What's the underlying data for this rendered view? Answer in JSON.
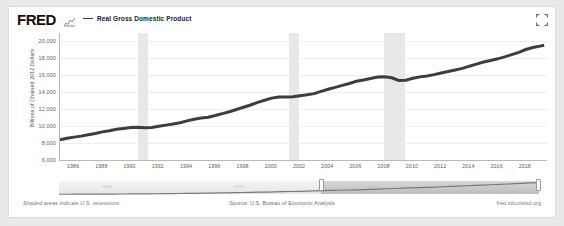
{
  "header": {
    "logo": "FRED",
    "logo_mark_icon": "fred-squiggle-icon",
    "legend_label": "Real Gross Domestic Product",
    "fullscreen_icon": "fullscreen-expand-icon"
  },
  "footer": {
    "left_note": "Shaded areas indicate U.S. recessions",
    "source": "Source: U.S. Bureau of Economic Analysis",
    "site": "fred.stlouisfed.org"
  },
  "slider": {
    "minimap_years": [
      "1950",
      "1970",
      "1990",
      "2010"
    ],
    "left_handle_icon": "slider-handle-left",
    "right_handle_icon": "slider-handle-right"
  },
  "chart_data": {
    "type": "line",
    "title": "",
    "xlabel": "",
    "ylabel": "Billions of Chained 2012 Dollars",
    "xlim": [
      1985.0,
      2019.5
    ],
    "ylim": [
      6000,
      21000
    ],
    "yticks": [
      6000,
      8000,
      10000,
      12000,
      14000,
      16000,
      18000,
      20000
    ],
    "ytick_labels": [
      "6,000",
      "8,000",
      "10,000",
      "12,000",
      "14,000",
      "16,000",
      "18,000",
      "20,000"
    ],
    "xticks": [
      1986,
      1988,
      1990,
      1992,
      1994,
      1996,
      1998,
      2000,
      2002,
      2004,
      2006,
      2008,
      2010,
      2012,
      2014,
      2016,
      2018
    ],
    "xtick_labels": [
      "1986",
      "1988",
      "1990",
      "1992",
      "1994",
      "1996",
      "1998",
      "2000",
      "2002",
      "2004",
      "2006",
      "2008",
      "2010",
      "2012",
      "2014",
      "2016",
      "2018"
    ],
    "grid": true,
    "legend_position": "top-left",
    "line_color": "#3d3d3d",
    "recession_color": "#e8e8e8",
    "recession_bands": [
      {
        "start": 1990.5,
        "end": 1991.2
      },
      {
        "start": 2001.2,
        "end": 2001.9
      },
      {
        "start": 2007.95,
        "end": 2009.45
      }
    ],
    "series": [
      {
        "name": "Real Gross Domestic Product",
        "x": [
          1985.0,
          1985.5,
          1986.0,
          1986.5,
          1987.0,
          1987.5,
          1988.0,
          1988.5,
          1989.0,
          1989.5,
          1990.0,
          1990.5,
          1991.0,
          1991.5,
          1992.0,
          1992.5,
          1993.0,
          1993.5,
          1994.0,
          1994.5,
          1995.0,
          1995.5,
          1996.0,
          1996.5,
          1997.0,
          1997.5,
          1998.0,
          1998.5,
          1999.0,
          1999.5,
          2000.0,
          2000.5,
          2001.0,
          2001.5,
          2002.0,
          2002.5,
          2003.0,
          2003.5,
          2004.0,
          2004.5,
          2005.0,
          2005.5,
          2006.0,
          2006.5,
          2007.0,
          2007.5,
          2008.0,
          2008.5,
          2009.0,
          2009.5,
          2010.0,
          2010.5,
          2011.0,
          2011.5,
          2012.0,
          2012.5,
          2013.0,
          2013.5,
          2014.0,
          2014.5,
          2015.0,
          2015.5,
          2016.0,
          2016.5,
          2017.0,
          2017.5,
          2018.0,
          2018.5,
          2019.0,
          2019.3
        ],
        "y": [
          8400,
          8560,
          8700,
          8820,
          8980,
          9140,
          9320,
          9450,
          9620,
          9720,
          9830,
          9860,
          9800,
          9850,
          9980,
          10120,
          10250,
          10400,
          10620,
          10820,
          10960,
          11050,
          11250,
          11480,
          11700,
          11960,
          12230,
          12500,
          12800,
          13050,
          13310,
          13440,
          13440,
          13470,
          13580,
          13700,
          13840,
          14100,
          14350,
          14580,
          14820,
          15040,
          15300,
          15460,
          15620,
          15790,
          15830,
          15710,
          15400,
          15430,
          15650,
          15820,
          15930,
          16080,
          16280,
          16450,
          16630,
          16820,
          17080,
          17320,
          17570,
          17760,
          17950,
          18180,
          18450,
          18720,
          19050,
          19280,
          19450,
          19560
        ]
      }
    ]
  }
}
